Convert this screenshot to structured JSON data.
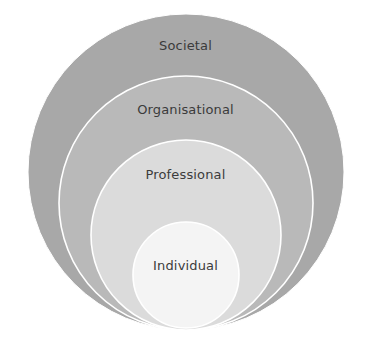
{
  "diagram": {
    "type": "nested-concentric-circles",
    "background_color": "#ffffff",
    "label_color": "#3b3b3b",
    "separator_color": "#ffffff",
    "canvas": {
      "width": 371,
      "height": 348
    },
    "levels": [
      {
        "id": "societal",
        "label": "Societal",
        "order": 1,
        "depth": "outermost",
        "fill": "#a8a8a8",
        "cx": 186,
        "cy": 172,
        "r": 158,
        "label_x": 186,
        "label_y": 46
      },
      {
        "id": "organisational",
        "label": "Organisational",
        "order": 2,
        "fill": "#b9b9b9",
        "cx": 186,
        "cy": 203,
        "r": 127,
        "label_x": 186,
        "label_y": 110
      },
      {
        "id": "professional",
        "label": "Professional",
        "order": 3,
        "fill": "#dbdbdb",
        "cx": 186,
        "cy": 235,
        "r": 95,
        "label_x": 186,
        "label_y": 175
      },
      {
        "id": "individual",
        "label": "Individual",
        "order": 4,
        "depth": "innermost",
        "fill": "#f4f4f4",
        "cx": 186,
        "cy": 275,
        "r": 53,
        "label_x": 186,
        "label_y": 266
      }
    ]
  }
}
